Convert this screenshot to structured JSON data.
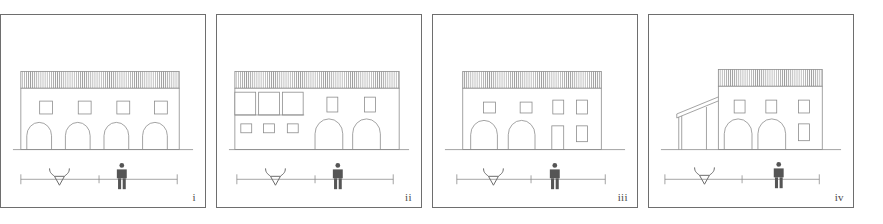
{
  "figure": {
    "type": "architectural-elevation-series",
    "background_color": "#ffffff",
    "line_color": "#8c8c8c",
    "frame_color": "#6e6e6e",
    "dark_fill": "#555555",
    "panel_count": 4,
    "canvas": {
      "width": 883,
      "height": 224
    }
  },
  "panels": [
    {
      "id": "panel-i",
      "label": "i",
      "frame": {
        "x": 16,
        "y": 14,
        "width": 206,
        "height": 194
      },
      "caption_position": "bottom-right",
      "building": {
        "name": "four-bay-arcade-elevation",
        "storeys": 2,
        "roof": {
          "type": "hatched-eaves-band",
          "hatch": "vertical-lines",
          "hatch_count": 64
        },
        "body": {
          "x": 34,
          "y": 86,
          "width": 140,
          "height": 50
        },
        "upper_windows": {
          "count": 4,
          "shape": "small-square"
        },
        "ground_openings": {
          "count": 4,
          "shape": "round-arch"
        },
        "side_wing": null
      },
      "scale_bar": {
        "ticks": [
          "left-end",
          "center",
          "right-end"
        ],
        "figures": [
          "ox-head-symbol",
          "human-figure"
        ]
      }
    },
    {
      "id": "panel-ii",
      "label": "ii",
      "frame": {
        "x": 232,
        "y": 14,
        "width": 206,
        "height": 194
      },
      "caption_position": "bottom-right",
      "building": {
        "name": "loggia-and-two-arch-elevation",
        "storeys": 2,
        "roof": {
          "type": "hatched-eaves-band",
          "hatch": "vertical-lines",
          "hatch_count": 64
        },
        "body": {
          "x": 30,
          "y": 86,
          "width": 146,
          "height": 50
        },
        "upper_left_openings": {
          "count": 3,
          "shape": "loggia-bay"
        },
        "upper_right_windows": {
          "count": 2,
          "shape": "tall-rectangle"
        },
        "lower_left_windows": {
          "count": 3,
          "shape": "small-square"
        },
        "ground_openings": {
          "count": 2,
          "shape": "round-arch"
        },
        "side_wing": null
      },
      "scale_bar": {
        "ticks": [
          "left-end",
          "center",
          "right-end"
        ],
        "figures": [
          "ox-head-symbol",
          "human-figure"
        ]
      }
    },
    {
      "id": "panel-iii",
      "label": "iii",
      "frame": {
        "x": 452,
        "y": 14,
        "width": 206,
        "height": 194
      },
      "caption_position": "bottom-right",
      "building": {
        "name": "two-arch-and-door-elevation",
        "storeys": 2,
        "roof": {
          "type": "hatched-eaves-band",
          "hatch": "vertical-lines",
          "hatch_count": 52
        },
        "body": {
          "x": 40,
          "y": 86,
          "width": 122,
          "height": 50
        },
        "upper_windows": {
          "count": 4,
          "shape": "mixed-square-and-tall"
        },
        "ground_openings": {
          "count": 2,
          "shape": "round-arch"
        },
        "ground_right": {
          "door_count": 1,
          "window_count": 1
        },
        "side_wing": null
      },
      "scale_bar": {
        "ticks": [
          "left-end",
          "center",
          "right-end"
        ],
        "figures": [
          "ox-head-symbol",
          "human-figure"
        ]
      }
    },
    {
      "id": "panel-iv",
      "label": "iv",
      "frame": {
        "x": 668,
        "y": 14,
        "width": 206,
        "height": 194
      },
      "caption_position": "bottom-right",
      "building": {
        "name": "two-arch-block-with-lean-to-shed",
        "storeys": 2,
        "roof": {
          "type": "hatched-eaves-band",
          "hatch": "vertical-lines",
          "hatch_count": 48
        },
        "body": {
          "x": 72,
          "y": 82,
          "width": 110,
          "height": 54
        },
        "upper_windows": {
          "count": 3,
          "shape": "small-square"
        },
        "ground_openings": {
          "count": 2,
          "shape": "round-arch"
        },
        "lower_right_windows": {
          "count": 1,
          "shape": "tall-rectangle"
        },
        "side_wing": {
          "type": "lean-to-shed",
          "side": "left",
          "posts": 2,
          "roof": "mono-pitch"
        }
      },
      "scale_bar": {
        "ticks": [
          "left-end",
          "center",
          "right-end"
        ],
        "figures": [
          "ox-head-symbol",
          "human-figure"
        ]
      }
    }
  ]
}
